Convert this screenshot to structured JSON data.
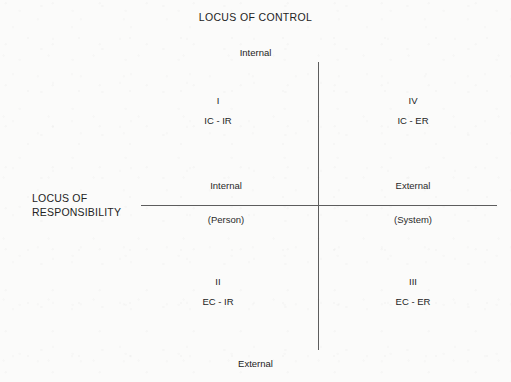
{
  "diagram": {
    "title": "LOCUS OF CONTROL",
    "vertical_axis": {
      "name": "LOCUS OF CONTROL",
      "top_label": "Internal",
      "bottom_label": "External"
    },
    "horizontal_axis": {
      "name_line1": "LOCUS OF",
      "name_line2": "RESPONSIBILITY",
      "left_label": "Internal",
      "left_sublabel": "(Person)",
      "right_label": "External",
      "right_sublabel": "(System)"
    },
    "quadrants": [
      {
        "roman": "I",
        "code": "IC - IR",
        "position": "top-left"
      },
      {
        "roman": "IV",
        "code": "IC - ER",
        "position": "top-right"
      },
      {
        "roman": "II",
        "code": "EC - IR",
        "position": "bottom-left"
      },
      {
        "roman": "III",
        "code": "EC - ER",
        "position": "bottom-right"
      }
    ],
    "colors": {
      "background": "#fbfbfa",
      "text": "#232323",
      "axis_line": "#5d5d5d"
    }
  }
}
